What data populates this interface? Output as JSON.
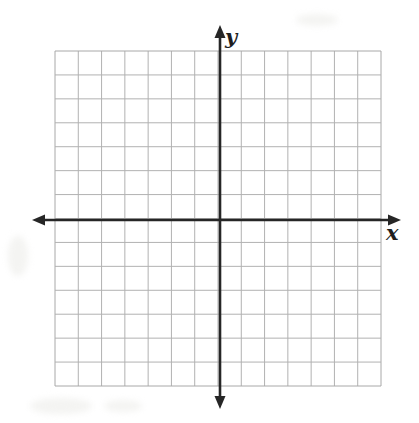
{
  "figure": {
    "kind": "coordinate-plane",
    "title": "",
    "width": 419,
    "height": 423,
    "background_color": "#ffffff"
  },
  "grid": {
    "columns": 14,
    "rows": 14,
    "cells_left_of_y_axis": 7,
    "cells_right_of_y_axis": 7,
    "cells_above_x_axis": 7,
    "cells_below_x_axis": 7,
    "cell_size_px": 23.3,
    "left_px": 55,
    "top_px": 51,
    "right_px": 381,
    "bottom_px": 386,
    "line_color": "#b2b2b2",
    "border_color": "#a8a8a8",
    "line_width_px": 1
  },
  "axes": {
    "color": "#262626",
    "line_width_px": 2.6,
    "origin_x_px": 220,
    "origin_y_px": 220,
    "x_axis": {
      "label": "x",
      "label_name": "x-axis-label",
      "y_px": 220,
      "start_px": 32,
      "end_px": 401,
      "arrow_start": true,
      "arrow_end": true
    },
    "y_axis": {
      "label": "y",
      "label_name": "y-axis-label",
      "x_px": 220,
      "start_px": 25,
      "end_px": 409,
      "arrow_start": true,
      "arrow_end": true
    }
  },
  "ticks": {
    "shown": false,
    "tick_labels": [],
    "axis_numbers_visible": false
  },
  "chart_data": {
    "type": "scatter",
    "title": "",
    "xlabel": "x",
    "ylabel": "y",
    "x": [],
    "y": [],
    "series": [],
    "annotations": [],
    "xlim": [
      -7,
      7
    ],
    "ylim": [
      -7,
      7
    ],
    "xticks": [
      -7,
      -6,
      -5,
      -4,
      -3,
      -2,
      -1,
      0,
      1,
      2,
      3,
      4,
      5,
      6,
      7
    ],
    "yticks": [
      -7,
      -6,
      -5,
      -4,
      -3,
      -2,
      -1,
      0,
      1,
      2,
      3,
      4,
      5,
      6,
      7
    ],
    "tick_labels_shown": false,
    "grid": true,
    "legend": false,
    "note": "Empty graph paper — no plotted data points or curves"
  }
}
